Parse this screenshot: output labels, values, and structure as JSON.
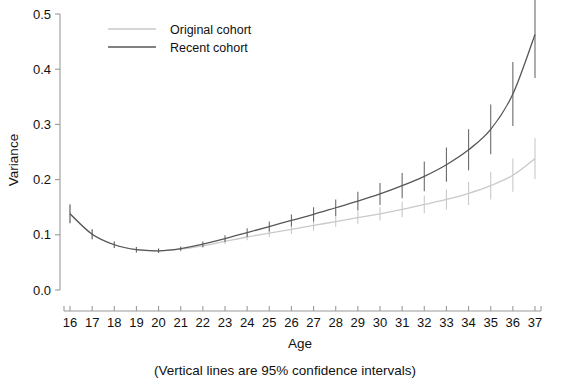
{
  "chart_data": {
    "type": "line",
    "title": "",
    "xlabel": "Age",
    "ylabel": "Variance",
    "caption": "(Vertical lines are 95% confidence intervals)",
    "xlim": [
      16,
      37
    ],
    "ylim": [
      0.0,
      0.5
    ],
    "grid": false,
    "legend_position": "top-left-inside",
    "x": [
      16,
      17,
      18,
      19,
      20,
      21,
      22,
      23,
      24,
      25,
      26,
      27,
      28,
      29,
      30,
      31,
      32,
      33,
      34,
      35,
      36,
      37
    ],
    "xticklabels": [
      "16",
      "17",
      "18",
      "19",
      "20",
      "21",
      "22",
      "23",
      "24",
      "25",
      "26",
      "27",
      "28",
      "29",
      "30",
      "31",
      "32",
      "33",
      "34",
      "35",
      "36",
      "37"
    ],
    "yticklabels": [
      "0.0",
      "0.1",
      "0.2",
      "0.3",
      "0.4",
      "0.5"
    ],
    "yticks": [
      0.0,
      0.1,
      0.2,
      0.3,
      0.4,
      0.5
    ],
    "series": [
      {
        "name": "Original cohort",
        "color": "#c9c9c9",
        "values": [
          0.138,
          0.101,
          0.082,
          0.073,
          0.071,
          0.074,
          0.08,
          0.088,
          0.096,
          0.103,
          0.11,
          0.117,
          0.124,
          0.131,
          0.138,
          0.146,
          0.155,
          0.164,
          0.175,
          0.189,
          0.208,
          0.238
        ],
        "ci_lower": [
          0.121,
          0.092,
          0.076,
          0.068,
          0.067,
          0.07,
          0.076,
          0.083,
          0.09,
          0.096,
          0.102,
          0.108,
          0.114,
          0.12,
          0.126,
          0.132,
          0.139,
          0.146,
          0.154,
          0.164,
          0.178,
          0.201
        ],
        "ci_upper": [
          0.155,
          0.11,
          0.088,
          0.078,
          0.075,
          0.078,
          0.084,
          0.093,
          0.102,
          0.11,
          0.118,
          0.126,
          0.134,
          0.142,
          0.15,
          0.16,
          0.171,
          0.182,
          0.196,
          0.214,
          0.238,
          0.275
        ]
      },
      {
        "name": "Recent cohort",
        "color": "#575757",
        "values": [
          0.138,
          0.101,
          0.082,
          0.073,
          0.071,
          0.075,
          0.083,
          0.093,
          0.104,
          0.115,
          0.126,
          0.137,
          0.149,
          0.161,
          0.174,
          0.189,
          0.206,
          0.227,
          0.254,
          0.291,
          0.355,
          0.463
        ],
        "ci_lower": [
          0.121,
          0.092,
          0.076,
          0.068,
          0.067,
          0.071,
          0.078,
          0.087,
          0.096,
          0.106,
          0.115,
          0.124,
          0.134,
          0.144,
          0.154,
          0.166,
          0.179,
          0.196,
          0.217,
          0.246,
          0.297,
          0.384
        ],
        "ci_upper": [
          0.155,
          0.11,
          0.088,
          0.078,
          0.075,
          0.079,
          0.088,
          0.099,
          0.112,
          0.124,
          0.137,
          0.15,
          0.164,
          0.178,
          0.194,
          0.212,
          0.233,
          0.258,
          0.291,
          0.336,
          0.413,
          0.542
        ]
      }
    ],
    "legend": [
      {
        "label": "Original cohort",
        "color": "#c9c9c9"
      },
      {
        "label": "Recent cohort",
        "color": "#575757"
      }
    ]
  }
}
